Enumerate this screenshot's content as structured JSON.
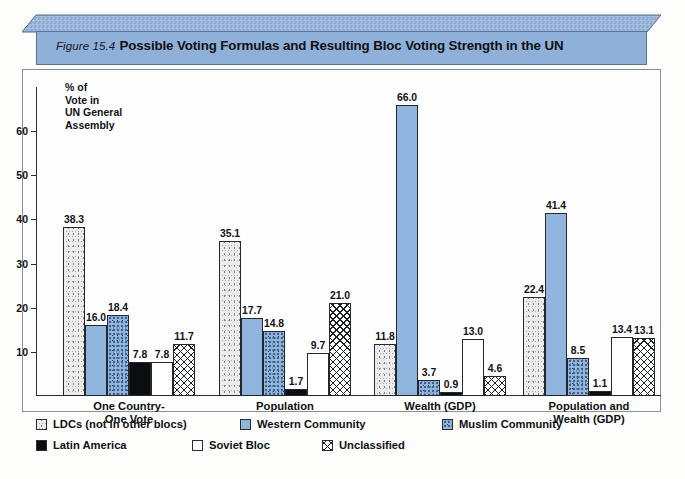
{
  "banner": {
    "figure_label": "Figure 15.4",
    "title": "Possible Voting Formulas and Resulting Bloc Voting Strength in the UN",
    "color": "#8fb0d8"
  },
  "axis_title": "% of\nVote in\nUN General\nAssembly",
  "axis_title_lines": [
    "% of",
    "Vote in",
    "UN General",
    "Assembly"
  ],
  "legend": {
    "rows": [
      [
        {
          "label": "LDCs (not in other blocs)",
          "swatch": "stipple-gray-swatch"
        },
        {
          "label": "Western Community",
          "swatch": "solid-blue-swatch"
        },
        {
          "label": "Muslim Community",
          "swatch": "stipple-blue-swatch"
        }
      ],
      [
        {
          "label": "Latin America",
          "swatch": "solid-black-swatch"
        },
        {
          "label": "Soviet Bloc",
          "swatch": "white-swatch"
        },
        {
          "label": "Unclassified",
          "swatch": "crosshatch-swatch"
        }
      ]
    ]
  },
  "chart_data": {
    "type": "bar",
    "title": "Possible Voting Formulas and Resulting Bloc Voting Strength in the UN",
    "xlabel": "",
    "ylabel": "% of Vote in UN General Assembly",
    "ylim": [
      0,
      70
    ],
    "yticks": [
      10,
      20,
      30,
      40,
      50,
      60
    ],
    "grid": false,
    "legend_position": "bottom-left",
    "categories": [
      "One Country-One Vote",
      "Population",
      "Wealth (GDP)",
      "Population and Wealth (GDP)"
    ],
    "category_lines": [
      [
        "One Country-",
        "One Vote"
      ],
      [
        "Population"
      ],
      [
        "Wealth (GDP)"
      ],
      [
        "Population and",
        "Wealth (GDP)"
      ]
    ],
    "series": [
      {
        "name": "LDCs (not in other blocs)",
        "fill": "f-ldc",
        "color": "#ececec",
        "values": [
          38.3,
          35.1,
          11.8,
          22.4
        ]
      },
      {
        "name": "Western Community",
        "fill": "f-west",
        "color": "#8fb4dd",
        "values": [
          16.0,
          17.7,
          66.0,
          41.4
        ]
      },
      {
        "name": "Muslim Community",
        "fill": "f-muslim",
        "color": "#8fb4dd",
        "values": [
          18.4,
          14.8,
          3.7,
          8.5
        ]
      },
      {
        "name": "Latin America",
        "fill": "f-latin",
        "color": "#0b0d10",
        "values": [
          7.8,
          1.7,
          0.9,
          1.1
        ]
      },
      {
        "name": "Soviet Bloc",
        "fill": "f-soviet",
        "color": "#ffffff",
        "values": [
          7.8,
          9.7,
          13.0,
          13.4
        ]
      },
      {
        "name": "Unclassified",
        "fill": "f-unc",
        "color": "#ffffff",
        "values": [
          11.7,
          21.0,
          4.6,
          13.1
        ]
      }
    ],
    "value_labels": [
      [
        "38.3",
        "16.0",
        "18.4",
        "7.8",
        "7.8",
        "11.7"
      ],
      [
        "35.1",
        "17.7",
        "14.8",
        "1.7",
        "9.7",
        "21.0"
      ],
      [
        "11.8",
        "66.0",
        "3.7",
        "0.9",
        "13.0",
        "4.6"
      ],
      [
        "22.4",
        "41.4",
        "8.5",
        "1.1",
        "13.4",
        "13.1"
      ]
    ]
  }
}
